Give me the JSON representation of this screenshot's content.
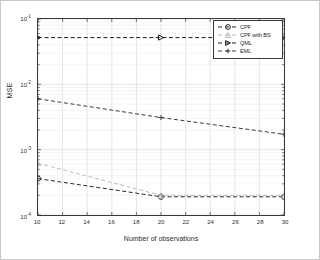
{
  "chart_data": {
    "type": "line",
    "title": "",
    "xlabel": "Number of observations",
    "ylabel": "MSE",
    "xscale": "linear",
    "yscale": "log",
    "xlim": [
      10,
      30
    ],
    "ylim": [
      0.0001,
      0.1
    ],
    "grid": true,
    "legend_position": "top-right",
    "xticks": [
      "10",
      "12",
      "14",
      "16",
      "18",
      "20",
      "22",
      "24",
      "26",
      "28",
      "30"
    ],
    "xtick_values": [
      10,
      12,
      14,
      16,
      18,
      20,
      22,
      24,
      26,
      28,
      30
    ],
    "ytick_values": [
      0.0001,
      0.001,
      0.01,
      0.1
    ],
    "yticks": [
      "10-4",
      "10-3",
      "10-2",
      "10-1"
    ],
    "ytick_mantissa": [
      "10",
      "10",
      "10",
      "10"
    ],
    "ytick_exponent": [
      "-4",
      "-3",
      "-2",
      "-1"
    ],
    "x": [
      10,
      20,
      30
    ],
    "series": [
      {
        "name": "CPF",
        "marker": "circle",
        "linestyle": "dashed",
        "color": "#262626",
        "values": [
          0.00036,
          0.00019,
          0.00019
        ]
      },
      {
        "name": "CPF with BS",
        "marker": "triangle-up",
        "linestyle": "dashed",
        "color": "#b9b9b9",
        "values": [
          0.00062,
          0.0002,
          0.0002
        ]
      },
      {
        "name": "QML",
        "marker": "triangle-right",
        "linestyle": "dashed",
        "color": "#1f1f1f",
        "values": [
          0.052,
          0.052,
          0.052
        ]
      },
      {
        "name": "EML",
        "marker": "plus",
        "linestyle": "dashed",
        "color": "#3a3a3a",
        "values": [
          0.006,
          0.0031,
          0.00172
        ]
      }
    ]
  },
  "legend": {
    "items": [
      {
        "label": "CPF"
      },
      {
        "label": "CPF with BS"
      },
      {
        "label": "QML"
      },
      {
        "label": "EML"
      }
    ]
  },
  "axes": {
    "x_title": "Number of observations",
    "y_title": "MSE"
  },
  "colors": {
    "axis": "#3a3a3a",
    "grid_major": "#d4d4d4",
    "grid_minor": "#ebebeb",
    "background": "#ffffff",
    "text": "#2b2b2b"
  }
}
